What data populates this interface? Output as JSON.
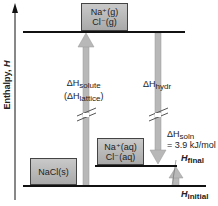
{
  "axis": {
    "label": "Enthalpy, ",
    "label_var": "H"
  },
  "levels": {
    "gas_ions": {
      "line1": "Na⁺(g)",
      "line2": "Cl⁻(g)"
    },
    "aqueous_ions": {
      "line1": "Na⁺(aq)",
      "line2": "Cl⁻(aq)"
    },
    "solid": {
      "label": "NaCl(s)"
    }
  },
  "arrows": {
    "solute": {
      "delta": "ΔH",
      "sub": "solute",
      "paren_open": "(ΔH",
      "paren_sub": "lattice",
      "paren_close": ")"
    },
    "hydration": {
      "delta": "ΔH",
      "sub": "hydr"
    },
    "solution": {
      "delta": "ΔH",
      "sub": "soln",
      "value": "= 3.9 kJ/mol"
    }
  },
  "enthalpy_labels": {
    "final": {
      "var": "H",
      "sub": "final"
    },
    "initial": {
      "var": "H",
      "sub": "initial"
    }
  },
  "colors": {
    "arrow_fill": "#b8b8b8",
    "box_fill_top": "#c9c9c9",
    "box_fill_bottom": "#a9a9a9",
    "line": "#111111"
  }
}
